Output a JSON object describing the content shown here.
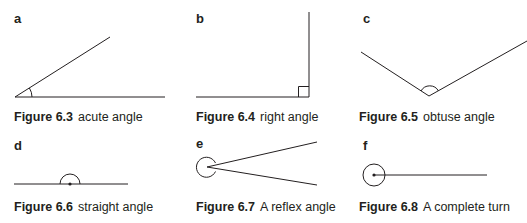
{
  "panels": [
    {
      "letter": "a",
      "figure": "Figure 6.3",
      "description": "acute angle"
    },
    {
      "letter": "b",
      "figure": "Figure 6.4",
      "description": "right angle"
    },
    {
      "letter": "c",
      "figure": "Figure 6.5",
      "description": "obtuse angle"
    },
    {
      "letter": "d",
      "figure": "Figure 6.6",
      "description": "straight angle"
    },
    {
      "letter": "e",
      "figure": "Figure 6.7",
      "description": "A reflex angle"
    },
    {
      "letter": "f",
      "figure": "Figure 6.8",
      "description": "A complete turn"
    }
  ],
  "colors": {
    "line": "#231f20",
    "background": "#ffffff"
  }
}
